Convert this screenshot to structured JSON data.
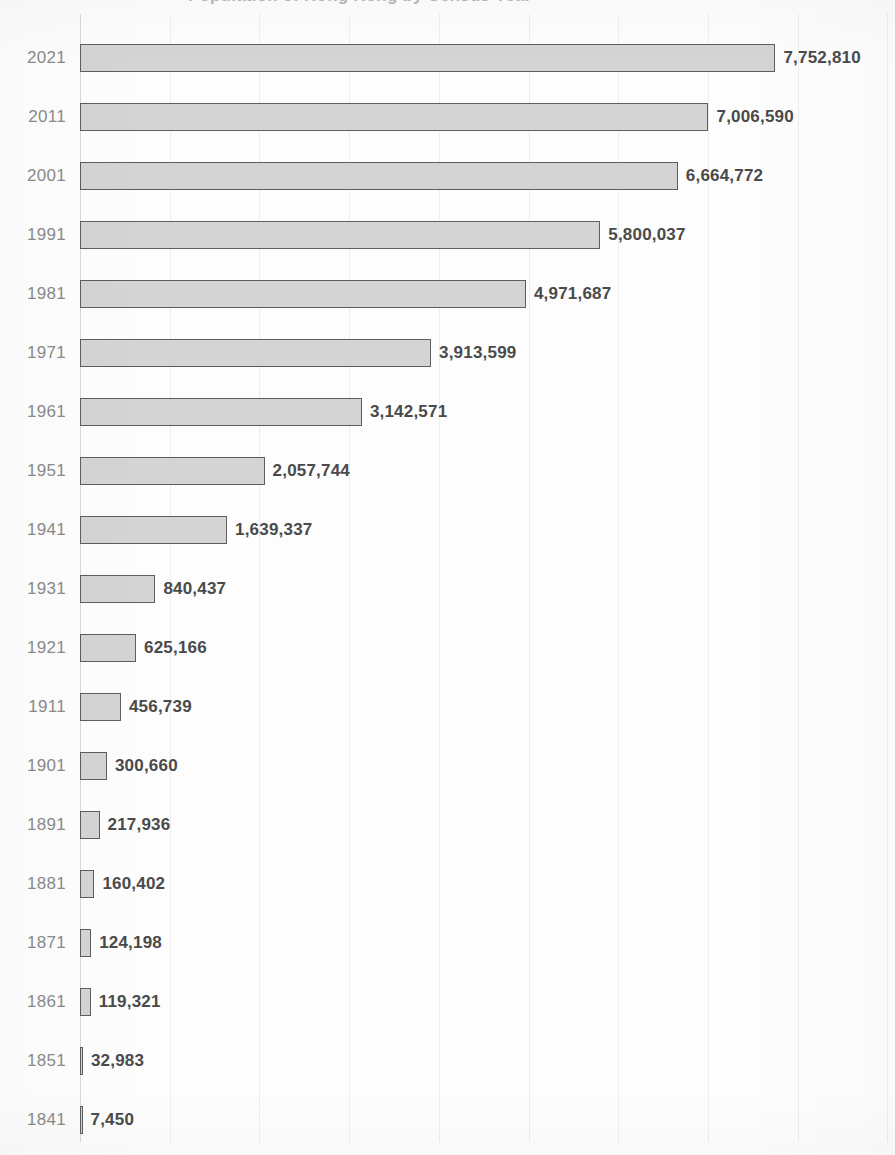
{
  "title": {
    "text": "Population of Hong Kong by Census Year",
    "cut_off": true
  },
  "chart_data": {
    "type": "bar",
    "orientation": "horizontal",
    "title": "Population of Hong Kong by Census Year",
    "xlabel": "",
    "ylabel": "",
    "grid": true,
    "gridline_interval": 1000000,
    "legend": "none",
    "xlim": [
      0,
      8000000
    ],
    "categories": [
      "2021",
      "2011",
      "2001",
      "1991",
      "1981",
      "1971",
      "1961",
      "1951",
      "1941",
      "1931",
      "1921",
      "1911",
      "1901",
      "1891",
      "1881",
      "1871",
      "1861",
      "1851",
      "1841"
    ],
    "values": [
      7752810,
      7006590,
      6664772,
      5800037,
      4971687,
      3913599,
      3142571,
      2057744,
      1639337,
      840437,
      625166,
      456739,
      300660,
      217936,
      160402,
      124198,
      119321,
      32983,
      7450
    ],
    "value_labels": [
      "7,752,810",
      "7,006,590",
      "6,664,772",
      "5,800,037",
      "4,971,687",
      "3,913,599",
      "3,142,571",
      "2,057,744",
      "1,639,337",
      "840,437",
      "625,166",
      "456,739",
      "300,660",
      "217,936",
      "160,402",
      "124,198",
      "119,321",
      "32,983",
      "7,450"
    ],
    "bar_fill_color": "#d4d4d4",
    "bar_border_color": "#5d5d5d",
    "category_label_color": "#8a8a8a",
    "value_label_color": "#4a4a4a",
    "gridline_color": "#ededee",
    "background_color": "#fdfdfd"
  },
  "rows": [
    {
      "category": "2021",
      "value": 7752810,
      "label": "7,752,810"
    },
    {
      "category": "2011",
      "value": 7006590,
      "label": "7,006,590"
    },
    {
      "category": "2001",
      "value": 6664772,
      "label": "6,664,772"
    },
    {
      "category": "1991",
      "value": 5800037,
      "label": "5,800,037"
    },
    {
      "category": "1981",
      "value": 4971687,
      "label": "4,971,687"
    },
    {
      "category": "1971",
      "value": 3913599,
      "label": "3,913,599"
    },
    {
      "category": "1961",
      "value": 3142571,
      "label": "3,142,571"
    },
    {
      "category": "1951",
      "value": 2057744,
      "label": "2,057,744"
    },
    {
      "category": "1941",
      "value": 1639337,
      "label": "1,639,337"
    },
    {
      "category": "1931",
      "value": 840437,
      "label": "840,437"
    },
    {
      "category": "1921",
      "value": 625166,
      "label": "625,166"
    },
    {
      "category": "1911",
      "value": 456739,
      "label": "456,739"
    },
    {
      "category": "1901",
      "value": 300660,
      "label": "300,660"
    },
    {
      "category": "1891",
      "value": 217936,
      "label": "217,936"
    },
    {
      "category": "1881",
      "value": 160402,
      "label": "160,402"
    },
    {
      "category": "1871",
      "value": 124198,
      "label": "124,198"
    },
    {
      "category": "1861",
      "value": 119321,
      "label": "119,321"
    },
    {
      "category": "1851",
      "value": 32983,
      "label": "32,983"
    },
    {
      "category": "1841",
      "value": 7450,
      "label": "7,450"
    }
  ],
  "layout": {
    "axis_x": 80,
    "row_height": 59,
    "first_row_center": 58,
    "bar_height": 28,
    "px_per_unit": 8.97e-05,
    "gridline_count": 9,
    "gridline_spacing": 89.7,
    "label_gap": 8
  }
}
